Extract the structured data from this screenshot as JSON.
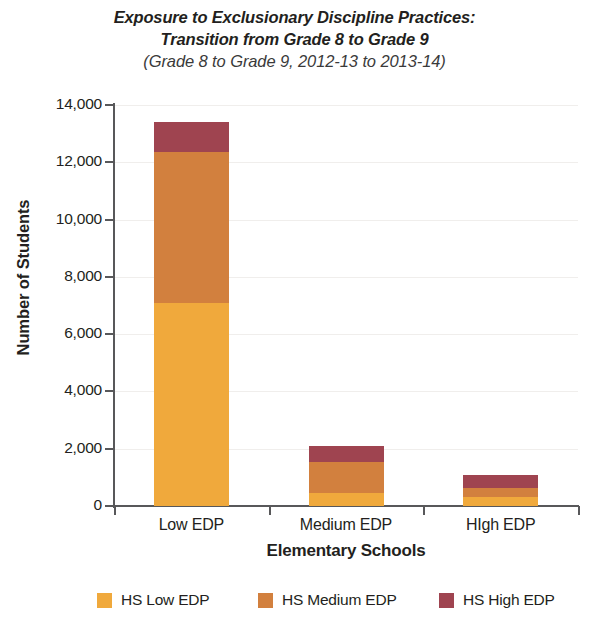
{
  "title": {
    "line1": "Exposure to Exclusionary Discipline Practices:",
    "line2": "Transition from Grade 8 to Grade 9",
    "line3": "(Grade 8 to Grade 9, 2012-13 to 2013-14)"
  },
  "chart_data": {
    "type": "bar",
    "subtype": "stacked-vertical",
    "title": "Exposure to Exclusionary Discipline Practices: Transition from Grade 8 to Grade 9 (Grade 8 to Grade 9, 2012-13 to 2013-14)",
    "xlabel": "Elementary Schools",
    "ylabel": "Number of Students",
    "categories": [
      "Low EDP",
      "Medium EDP",
      "HIgh EDP"
    ],
    "series": [
      {
        "name": "HS Low EDP",
        "color": "#F0A93C",
        "values": [
          7100,
          450,
          300
        ]
      },
      {
        "name": "HS Medium EDP",
        "color": "#D2803E",
        "values": [
          5250,
          1090,
          330
        ]
      },
      {
        "name": "HS High EDP",
        "color": "#9F4450",
        "values": [
          1050,
          560,
          450
        ]
      }
    ],
    "totals": [
      13400,
      2100,
      1080
    ],
    "ylim": [
      0,
      14000
    ],
    "ytick_values": [
      0,
      2000,
      4000,
      6000,
      8000,
      10000,
      12000,
      14000
    ],
    "ytick_labels": [
      "0",
      "2,000",
      "4,000",
      "6,000",
      "8,000",
      "10,000",
      "12,000",
      "14,000"
    ],
    "grid": "horizontal-faint",
    "legend_position": "bottom"
  },
  "legend": {
    "items": [
      {
        "label": "HS Low EDP",
        "color": "#F0A93C"
      },
      {
        "label": "HS Medium EDP",
        "color": "#D2803E"
      },
      {
        "label": "HS High EDP",
        "color": "#9F4450"
      }
    ]
  }
}
